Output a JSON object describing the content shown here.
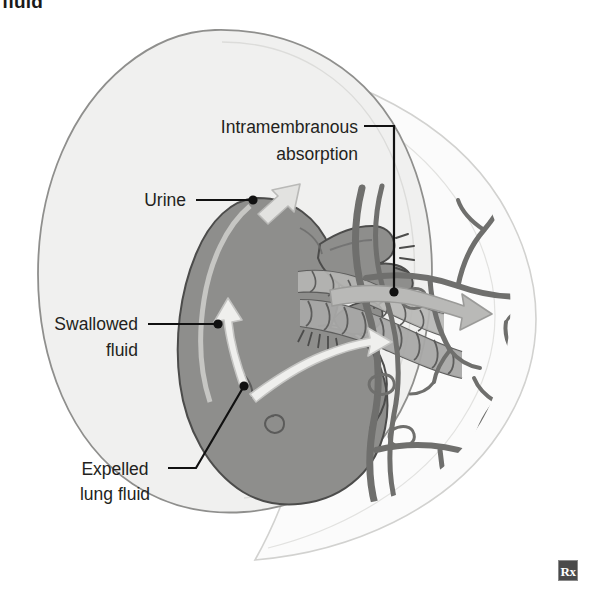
{
  "figure": {
    "title_fragment": "fluid",
    "watermark": "Rx",
    "palette": {
      "background": "#ffffff",
      "amniotic_sac_fill": "#f0f0ef",
      "amniotic_sac_stroke": "#9a9a98",
      "placenta_fill": "#fbfbfb",
      "placenta_stroke": "#cfcfcd",
      "fetus_fill": "#8e8e8c",
      "fetus_stroke": "#4f4f4e",
      "cord_fill": "#a8a8a6",
      "cord_stroke": "#5d5d5c",
      "villi_stroke": "#6f6f6d",
      "white_arrow": "#e9e9e7",
      "gray_arrow": "#b5b5b3",
      "label_text": "#231f20",
      "leader_line": "#111111"
    }
  },
  "labels": [
    {
      "id": "intramembranous-absorption",
      "name": "label-intramembranous-absorption",
      "lines": [
        "Intramembranous",
        "absorption"
      ],
      "align": "end",
      "text_x": 358,
      "line_y": [
        133,
        160
      ],
      "leader_path": "M 364 126 L 394 126 L 394 292",
      "dot": {
        "x": 394,
        "y": 292
      }
    },
    {
      "id": "urine",
      "name": "label-urine",
      "lines": [
        "Urine"
      ],
      "align": "end",
      "text_x": 186,
      "line_y": [
        206
      ],
      "leader_path": "M 196 200 L 253 200",
      "dot": {
        "x": 253,
        "y": 200
      }
    },
    {
      "id": "swallowed-fluid",
      "name": "label-swallowed-fluid",
      "lines": [
        "Swallowed",
        "fluid"
      ],
      "align": "end",
      "text_x": 138,
      "line_y": [
        330,
        356
      ],
      "leader_path": "M 148 324 L 218 324",
      "dot": {
        "x": 218,
        "y": 324
      }
    },
    {
      "id": "expelled-lung-fluid",
      "name": "label-expelled-lung-fluid",
      "lines": [
        "Expelled",
        "lung fluid"
      ],
      "align": "middle",
      "text_x": 115,
      "line_y": [
        475,
        500
      ],
      "leader_path": "M 168 468 L 196 468 L 244 386",
      "dot": {
        "x": 244,
        "y": 386
      }
    }
  ]
}
